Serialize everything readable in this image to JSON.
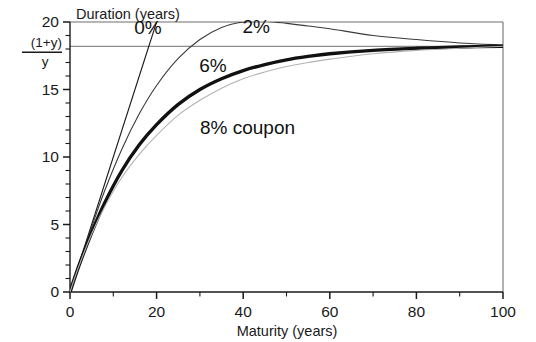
{
  "chart_data": {
    "type": "line",
    "title": "",
    "subtitle": "",
    "xlabel": "Maturity (years)",
    "ylabel": "Duration (years)",
    "xlim": [
      0,
      100
    ],
    "ylim": [
      0,
      20
    ],
    "grid": false,
    "legend_position": "inline-annotations",
    "x_ticks_major": [
      0,
      20,
      40,
      60,
      80,
      100
    ],
    "x_ticks_minor_step": 10,
    "y_ticks_major": [
      0,
      5,
      10,
      15,
      20
    ],
    "y_ticks_minor_step": 1,
    "x_tick_labels": [
      "0",
      "20",
      "40",
      "60",
      "80",
      "100"
    ],
    "y_tick_labels": [
      "0",
      "5",
      "10",
      "15",
      "20"
    ],
    "asymptote": {
      "label_numerator": "(1+y)",
      "label_denominator": "y",
      "value": 18.2,
      "color": "#8c8c8c"
    },
    "series": [
      {
        "name": "0%",
        "label": "0%",
        "color": "#1a1a1a",
        "width": 1.1,
        "x": [
          0,
          2,
          4,
          6,
          8,
          10,
          12,
          14,
          16,
          18,
          20,
          20.6
        ],
        "values": [
          0,
          2,
          4,
          6,
          8,
          10,
          12,
          14,
          16,
          18,
          20,
          20.6
        ]
      },
      {
        "name": "2%",
        "label": "2%",
        "color": "#3a3a3a",
        "width": 1.1,
        "x": [
          0,
          2,
          5,
          8,
          12,
          16,
          20,
          25,
          30,
          35,
          40,
          45,
          50,
          55,
          60,
          70,
          80,
          90,
          100
        ],
        "values": [
          0,
          1.98,
          4.8,
          7.5,
          10.6,
          13.2,
          15.3,
          17.3,
          18.7,
          19.6,
          20.0,
          20.05,
          19.9,
          19.7,
          19.5,
          19.0,
          18.7,
          18.45,
          18.3
        ]
      },
      {
        "name": "6%",
        "label": "6%",
        "color": "#111111",
        "width": 3.4,
        "x": [
          0,
          2,
          5,
          8,
          12,
          16,
          20,
          25,
          30,
          35,
          40,
          45,
          50,
          55,
          60,
          70,
          80,
          90,
          100
        ],
        "values": [
          0,
          1.9,
          4.4,
          6.6,
          9.0,
          10.9,
          12.4,
          13.9,
          15.0,
          15.8,
          16.4,
          16.85,
          17.2,
          17.45,
          17.65,
          17.9,
          18.05,
          18.15,
          18.2
        ]
      },
      {
        "name": "8% coupon",
        "label": "8% coupon",
        "color": "#b3b3b3",
        "width": 1.1,
        "x": [
          0,
          2,
          5,
          8,
          12,
          16,
          20,
          25,
          30,
          35,
          40,
          45,
          50,
          55,
          60,
          70,
          80,
          90,
          100
        ],
        "values": [
          0,
          1.88,
          4.3,
          6.3,
          8.5,
          10.2,
          11.6,
          13.1,
          14.2,
          15.1,
          15.8,
          16.3,
          16.7,
          17.0,
          17.25,
          17.65,
          17.9,
          18.05,
          18.2
        ]
      }
    ],
    "annotations": [
      {
        "text": "0%",
        "x": 18,
        "y": 19.1
      },
      {
        "text": "2%",
        "x": 43,
        "y": 19.2
      },
      {
        "text": "6%",
        "x": 33,
        "y": 16.3
      },
      {
        "text": "8% coupon",
        "x": 41,
        "y": 11.7
      }
    ]
  }
}
